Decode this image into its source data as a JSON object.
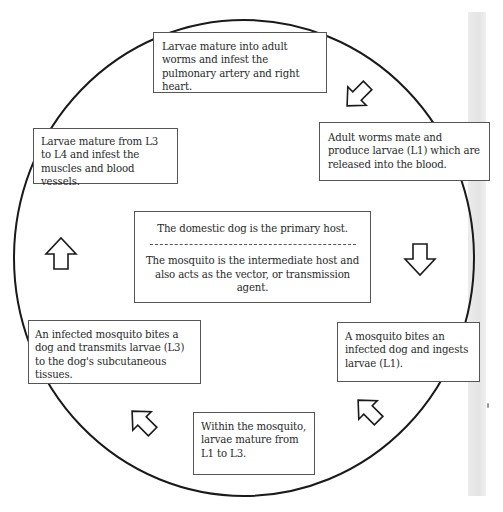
{
  "diagram": {
    "type": "life-cycle",
    "shape": "ellipse",
    "stroke_color": "#1a1a1a",
    "box_border_color": "#555555",
    "background_color": "#ffffff",
    "center": {
      "primary_host": "The domestic dog is the primary host.",
      "intermediate_host": "The mosquito is the intermediate host and also acts as the vector, or transmission agent."
    },
    "steps": [
      {
        "id": "adult-worms-pulmonary",
        "text": "Larvae mature into adult worms and infest the pulmonary artery and right heart."
      },
      {
        "id": "adults-mate",
        "text": "Adult worms mate and produce larvae (L1) which are released into the blood."
      },
      {
        "id": "mosquito-ingests",
        "text": "A mosquito bites an infected dog and ingests larvae (L1)."
      },
      {
        "id": "mature-in-mosquito",
        "text": "Within the mosquito, larvae mature from L1 to L3."
      },
      {
        "id": "mosquito-transmits",
        "text": "An infected mosquito bites a dog and transmits larvae (L3) to the dog's subcutaneous tissues."
      },
      {
        "id": "l3-to-l4",
        "text": "Larvae mature from L3 to L4 and infest the muscles and blood vessels."
      }
    ],
    "arrows": [
      {
        "from": "adult-worms-pulmonary",
        "to": "adults-mate",
        "direction": "down-right"
      },
      {
        "from": "adults-mate",
        "to": "mosquito-ingests",
        "direction": "down"
      },
      {
        "from": "mosquito-ingests",
        "to": "mature-in-mosquito",
        "direction": "down-left"
      },
      {
        "from": "mature-in-mosquito",
        "to": "mosquito-transmits",
        "direction": "up-left"
      },
      {
        "from": "mosquito-transmits",
        "to": "l3-to-l4",
        "direction": "up"
      },
      {
        "from": "l3-to-l4",
        "to": "adult-worms-pulmonary",
        "direction": "up"
      }
    ]
  }
}
